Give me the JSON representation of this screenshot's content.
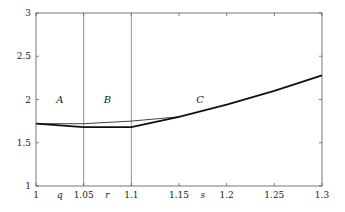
{
  "chart_data": {
    "type": "line",
    "title": "",
    "xlabel": "",
    "ylabel": "",
    "xlim": [
      1,
      1.3
    ],
    "ylim": [
      1,
      3
    ],
    "grid": false,
    "legend": null,
    "x_ticks": [
      {
        "value": 1,
        "label": "1"
      },
      {
        "value": 1.05,
        "label": "1.05"
      },
      {
        "value": 1.1,
        "label": "1.1"
      },
      {
        "value": 1.15,
        "label": "1.15"
      },
      {
        "value": 1.2,
        "label": "1.2"
      },
      {
        "value": 1.25,
        "label": "1.25"
      },
      {
        "value": 1.3,
        "label": "1.3"
      }
    ],
    "y_ticks": [
      {
        "value": 1,
        "label": "1"
      },
      {
        "value": 1.5,
        "label": "1.5"
      },
      {
        "value": 2,
        "label": "2"
      },
      {
        "value": 2.5,
        "label": "2.5"
      },
      {
        "value": 3,
        "label": "3"
      }
    ],
    "axis_variable_labels": [
      {
        "x": 1.025,
        "label": "q"
      },
      {
        "x": 1.075,
        "label": "r"
      },
      {
        "x": 1.175,
        "label": "s"
      }
    ],
    "vertical_lines": [
      1.05,
      1.1
    ],
    "region_labels": [
      {
        "x": 1.025,
        "y": 2.0,
        "label": "A"
      },
      {
        "x": 1.075,
        "y": 2.0,
        "label": "B"
      },
      {
        "x": 1.172,
        "y": 2.0,
        "label": "C"
      }
    ],
    "series": [
      {
        "name": "thick",
        "style": "thick",
        "x": [
          1.0,
          1.05,
          1.1,
          1.15,
          1.2,
          1.25,
          1.3
        ],
        "values": [
          1.72,
          1.68,
          1.68,
          1.8,
          1.94,
          2.1,
          2.28
        ]
      },
      {
        "name": "thin",
        "style": "thin",
        "x": [
          1.0,
          1.05,
          1.1,
          1.15
        ],
        "values": [
          1.72,
          1.72,
          1.75,
          1.8
        ]
      }
    ]
  }
}
